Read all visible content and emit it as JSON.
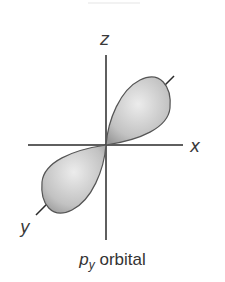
{
  "diagram": {
    "title_partial": "p_x orbital",
    "axes": {
      "z": {
        "label": "z"
      },
      "x": {
        "label": "x"
      },
      "y": {
        "label": "y"
      }
    },
    "caption": {
      "p": "p",
      "subscript": "y",
      "text": " orbital"
    },
    "colors": {
      "lobe_fill_light": "#e6e6e6",
      "lobe_fill_dark": "#9a9a9a",
      "axis": "#2a2a2a"
    }
  }
}
